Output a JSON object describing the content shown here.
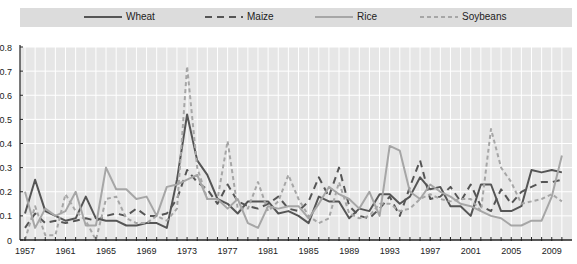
{
  "chart_data": {
    "type": "line",
    "title": "",
    "xlabel": "",
    "ylabel": "",
    "ylim": [
      0,
      0.8
    ],
    "xlim": [
      1957,
      2010
    ],
    "grid": true,
    "legend_position": "top",
    "y_ticks": [
      "0",
      "0.1",
      "0.2",
      "0.3",
      "0.4",
      "0.5",
      "0.6",
      "0.7",
      "0.8"
    ],
    "x_tick_labels": [
      "1957",
      "1961",
      "1965",
      "1969",
      "1973",
      "1977",
      "1981",
      "1985",
      "1989",
      "1993",
      "1997",
      "2001",
      "2005",
      "2009"
    ],
    "x": [
      1957,
      1958,
      1959,
      1960,
      1961,
      1962,
      1963,
      1964,
      1965,
      1966,
      1967,
      1968,
      1969,
      1970,
      1971,
      1972,
      1973,
      1974,
      1975,
      1976,
      1977,
      1978,
      1979,
      1980,
      1981,
      1982,
      1983,
      1984,
      1985,
      1986,
      1987,
      1988,
      1989,
      1990,
      1991,
      1992,
      1993,
      1994,
      1995,
      1996,
      1997,
      1998,
      1999,
      2000,
      2001,
      2002,
      2003,
      2004,
      2005,
      2006,
      2007,
      2008,
      2009,
      2010
    ],
    "series": [
      {
        "name": "Wheat",
        "style": "solid",
        "color": "#555555",
        "values": [
          0.11,
          0.25,
          0.12,
          0.1,
          0.08,
          0.09,
          0.18,
          0.09,
          0.08,
          0.08,
          0.06,
          0.06,
          0.07,
          0.07,
          0.05,
          0.25,
          0.52,
          0.33,
          0.27,
          0.17,
          0.15,
          0.11,
          0.16,
          0.16,
          0.16,
          0.11,
          0.12,
          0.1,
          0.07,
          0.18,
          0.16,
          0.16,
          0.09,
          0.13,
          0.12,
          0.19,
          0.19,
          0.15,
          0.18,
          0.26,
          0.21,
          0.22,
          0.14,
          0.14,
          0.1,
          0.23,
          0.23,
          0.12,
          0.12,
          0.14,
          0.29,
          0.28,
          0.29,
          0.28
        ]
      },
      {
        "name": "Maize",
        "style": "dashed",
        "color": "#555555",
        "values": [
          0.05,
          0.11,
          0.07,
          0.08,
          0.07,
          0.08,
          0.09,
          0.08,
          0.1,
          0.11,
          0.1,
          0.13,
          0.1,
          0.1,
          0.11,
          0.17,
          0.29,
          0.24,
          0.21,
          0.15,
          0.23,
          0.16,
          0.14,
          0.13,
          0.15,
          0.18,
          0.13,
          0.12,
          0.16,
          0.26,
          0.18,
          0.3,
          0.14,
          0.1,
          0.09,
          0.13,
          0.18,
          0.1,
          0.22,
          0.33,
          0.17,
          0.18,
          0.22,
          0.16,
          0.23,
          0.14,
          0.12,
          0.21,
          0.15,
          0.2,
          0.22,
          0.24,
          0.24,
          0.25
        ]
      },
      {
        "name": "Rice",
        "style": "solid",
        "color": "#a6a6a6",
        "values": [
          0.2,
          0.05,
          0.13,
          0.1,
          0.12,
          0.2,
          0.06,
          0.06,
          0.3,
          0.21,
          0.21,
          0.17,
          0.18,
          0.1,
          0.22,
          0.23,
          0.25,
          0.27,
          0.17,
          0.17,
          0.13,
          0.17,
          0.07,
          0.05,
          0.14,
          0.13,
          0.14,
          0.14,
          0.09,
          0.15,
          0.22,
          0.19,
          0.17,
          0.13,
          0.2,
          0.1,
          0.39,
          0.37,
          0.2,
          0.17,
          0.23,
          0.2,
          0.18,
          0.15,
          0.14,
          0.12,
          0.1,
          0.09,
          0.06,
          0.06,
          0.08,
          0.08,
          0.18,
          0.35
        ]
      },
      {
        "name": "Soybeans",
        "style": "dashed",
        "color": "#a6a6a6",
        "values": [
          0.0,
          0.14,
          0.02,
          0.02,
          0.19,
          0.12,
          0.08,
          0.0,
          0.17,
          0.18,
          0.09,
          0.07,
          0.07,
          0.1,
          0.08,
          0.13,
          0.72,
          0.3,
          0.17,
          0.17,
          0.41,
          0.13,
          0.13,
          0.24,
          0.12,
          0.16,
          0.27,
          0.17,
          0.1,
          0.07,
          0.09,
          0.24,
          0.11,
          0.09,
          0.1,
          0.15,
          0.15,
          0.12,
          0.13,
          0.17,
          0.19,
          0.17,
          0.16,
          0.17,
          0.17,
          0.12,
          0.46,
          0.3,
          0.24,
          0.15,
          0.16,
          0.17,
          0.19,
          0.16
        ]
      }
    ]
  },
  "legend": {
    "items": [
      {
        "label": "Wheat"
      },
      {
        "label": "Maize"
      },
      {
        "label": "Rice"
      },
      {
        "label": "Soybeans"
      }
    ]
  },
  "colors": {
    "plot_background": "#e6e6e6",
    "legend_background": "#dcdcdc",
    "grid": "#ffffff",
    "axis": "#222222"
  }
}
